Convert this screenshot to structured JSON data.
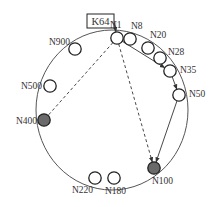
{
  "diagram": {
    "type": "chord-ring",
    "colors": {
      "ring": "#555555",
      "node_stroke": "#222222",
      "node_fill": "#ffffff",
      "highlight_fill": "#6a6a6a",
      "text": "#333333",
      "edge": "#333333"
    },
    "key_box": {
      "label": "K64",
      "x": 87,
      "y": 14,
      "w": 27,
      "h": 14
    },
    "ring": {
      "cx": 112,
      "cy": 110,
      "rx": 76,
      "ry": 80
    },
    "nodes": [
      {
        "id": "N1",
        "label": "N1",
        "x": 117,
        "y": 38,
        "highlight": false,
        "lx": 110,
        "ly": 28,
        "anchor": "start"
      },
      {
        "id": "N8",
        "label": "N8",
        "x": 130,
        "y": 39,
        "highlight": false,
        "lx": 131,
        "ly": 29,
        "anchor": "start"
      },
      {
        "id": "N20",
        "label": "N20",
        "x": 148,
        "y": 48,
        "highlight": false,
        "lx": 150,
        "ly": 38,
        "anchor": "start"
      },
      {
        "id": "N28",
        "label": "N28",
        "x": 160,
        "y": 58,
        "highlight": false,
        "lx": 168,
        "ly": 55,
        "anchor": "start"
      },
      {
        "id": "N35",
        "label": "N35",
        "x": 170,
        "y": 71,
        "highlight": false,
        "lx": 180,
        "ly": 73,
        "anchor": "start"
      },
      {
        "id": "N50",
        "label": "N50",
        "x": 179,
        "y": 95,
        "highlight": false,
        "lx": 189,
        "ly": 97,
        "anchor": "start"
      },
      {
        "id": "N100",
        "label": "N100",
        "x": 154,
        "y": 168,
        "highlight": true,
        "lx": 152,
        "ly": 184,
        "anchor": "start"
      },
      {
        "id": "N180",
        "label": "N180",
        "x": 114,
        "y": 178,
        "highlight": false,
        "lx": 105,
        "ly": 194,
        "anchor": "start"
      },
      {
        "id": "N220",
        "label": "N220",
        "x": 95,
        "y": 178,
        "highlight": false,
        "lx": 72,
        "ly": 193,
        "anchor": "start"
      },
      {
        "id": "N400",
        "label": "N400",
        "x": 44,
        "y": 120,
        "highlight": true,
        "lx": 16,
        "ly": 124,
        "anchor": "start"
      },
      {
        "id": "N500",
        "label": "N500",
        "x": 50,
        "y": 86,
        "highlight": false,
        "lx": 21,
        "ly": 89,
        "anchor": "start"
      },
      {
        "id": "N900",
        "label": "N900",
        "x": 75,
        "y": 49,
        "highlight": false,
        "lx": 49,
        "ly": 45,
        "anchor": "start"
      }
    ],
    "edges": [
      {
        "from": "K64",
        "to": "N1",
        "style": "solid-arrow"
      },
      {
        "from": "N1",
        "to": "N35",
        "style": "solid-arrow"
      },
      {
        "from": "N35",
        "to": "N50",
        "style": "solid-arrow"
      },
      {
        "from": "N50",
        "to": "N100",
        "style": "solid-arrow"
      },
      {
        "from": "N1",
        "to": "N100",
        "style": "dashed-arrow"
      },
      {
        "from": "N1",
        "to": "N400",
        "style": "dashed"
      }
    ]
  }
}
